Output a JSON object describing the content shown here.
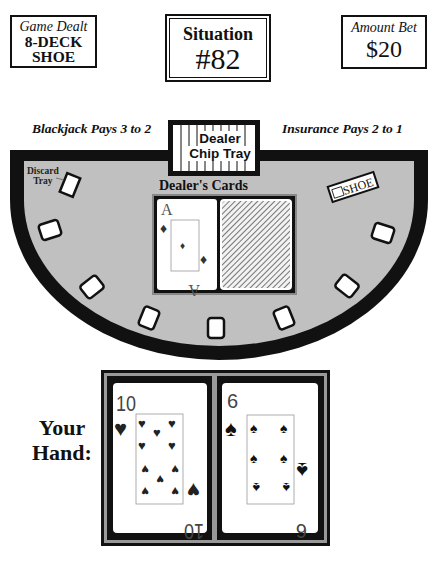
{
  "game_info": {
    "deck_box": {
      "line1": "Game Dealt",
      "line2": "8-DECK",
      "line3": "SHOE"
    },
    "situation_box": {
      "label": "Situation",
      "number": "#82"
    },
    "bet_box": {
      "label": "Amount Bet",
      "amount": "$20"
    }
  },
  "table": {
    "rule_left": "Blackjack Pays 3 to 2",
    "rule_right": "Insurance Pays 2 to 1",
    "chip_tray": {
      "line1": "Dealer",
      "line2": "Chip Tray"
    },
    "discard_tray": {
      "line1": "Discard",
      "line2": "Tray"
    },
    "shoe_label": "SHOE",
    "dealer_cards_label": "Dealer's Cards",
    "felt_color": "#c0c0c0",
    "rail_color": "#111111",
    "betting_spots": 7
  },
  "dealer": {
    "cards": [
      {
        "rank": "A",
        "suit": "diamonds",
        "suit_icon": "♦",
        "face_up": true
      },
      {
        "rank": "",
        "suit": "",
        "face_up": false
      }
    ]
  },
  "player": {
    "label_line1": "Your",
    "label_line2": "Hand:",
    "cards": [
      {
        "rank": "10",
        "suit": "hearts",
        "suit_icon": "♥",
        "face_up": true
      },
      {
        "rank": "6",
        "suit": "spades",
        "suit_icon": "♠",
        "face_up": true
      }
    ]
  }
}
